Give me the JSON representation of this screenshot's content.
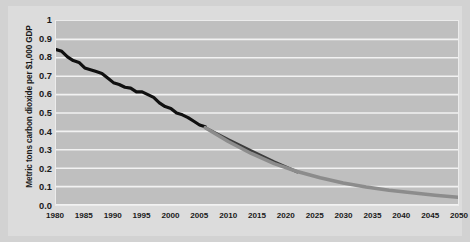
{
  "chart_data": {
    "type": "line",
    "title": "",
    "xlabel": "",
    "ylabel": "Metric tons carbon dioxide per $1,000 GDP",
    "xlim": [
      1980,
      2050
    ],
    "ylim": [
      0,
      1
    ],
    "grid": "horizontal",
    "legend": "none",
    "background_color": "#bfbfbf",
    "gridline_color": "#f2f2f2",
    "x_ticks": [
      1980,
      1985,
      1990,
      1995,
      2000,
      2005,
      2010,
      2015,
      2020,
      2025,
      2030,
      2035,
      2040,
      2045,
      2050
    ],
    "x_tick_labels": [
      "1980",
      "1985",
      "1990",
      "1995",
      "2000",
      "2005",
      "2010",
      "2015",
      "2020",
      "2025",
      "2030",
      "2035",
      "2040",
      "2045",
      "2050"
    ],
    "y_ticks": [
      1,
      0.9,
      0.8,
      0.7,
      0.6,
      0.5,
      0.4,
      0.3,
      0.2,
      0.1,
      0
    ],
    "y_tick_labels": [
      "1",
      "0.9",
      "0.8",
      "0.7",
      "0.6",
      "0.5",
      "0.4",
      "0.3",
      "0.2",
      "0.1",
      "0.0"
    ],
    "series": [
      {
        "name": "History",
        "color": "#101010",
        "width": 3.2,
        "x": [
          1980,
          1981,
          1982,
          1983,
          1984,
          1985,
          1986,
          1987,
          1988,
          1989,
          1990,
          1991,
          1992,
          1993,
          1994,
          1995,
          1996,
          1997,
          1998,
          1999,
          2000,
          2001,
          2002,
          2003,
          2004,
          2005,
          2006
        ],
        "values": [
          0.845,
          0.835,
          0.805,
          0.785,
          0.775,
          0.745,
          0.735,
          0.725,
          0.715,
          0.69,
          0.665,
          0.655,
          0.64,
          0.635,
          0.615,
          0.615,
          0.6,
          0.585,
          0.555,
          0.535,
          0.525,
          0.5,
          0.49,
          0.475,
          0.455,
          0.435,
          0.425
        ]
      },
      {
        "name": "Projection trend",
        "color": "#3c3c3c",
        "width": 3.0,
        "x": [
          2006,
          2010,
          2014,
          2018,
          2022
        ],
        "values": [
          0.42,
          0.355,
          0.295,
          0.235,
          0.18
        ]
      },
      {
        "name": "Projection curve",
        "color": "#8c8c8c",
        "width": 3.6,
        "x": [
          2006,
          2010,
          2014,
          2018,
          2022,
          2026,
          2030,
          2034,
          2038,
          2042,
          2046,
          2050
        ],
        "values": [
          0.42,
          0.345,
          0.28,
          0.225,
          0.182,
          0.148,
          0.12,
          0.098,
          0.08,
          0.066,
          0.053,
          0.042
        ]
      }
    ]
  }
}
